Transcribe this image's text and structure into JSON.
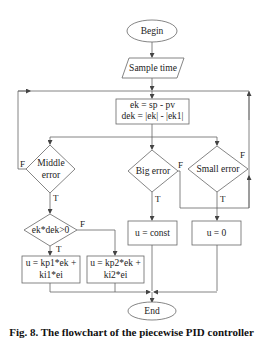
{
  "diagram": {
    "type": "flowchart",
    "nodes": {
      "begin": {
        "label": "Begin",
        "shape": "ellipse"
      },
      "sample": {
        "label": "Sample time",
        "shape": "parallelogram"
      },
      "compute_line1": {
        "label": "ek = sp - pv",
        "shape": "rect"
      },
      "compute_line2": {
        "label": "dek = |ek| - |ek1|",
        "shape": "rect"
      },
      "middle_error_1": {
        "label": "Middle",
        "shape": "diamond"
      },
      "middle_error_2": {
        "label": "error",
        "shape": "diamond"
      },
      "big_error": {
        "label": "Big error",
        "shape": "diamond"
      },
      "small_error": {
        "label": "Small error",
        "shape": "diamond"
      },
      "ekdek": {
        "label": "ek*dek>0",
        "shape": "diamond"
      },
      "u_const": {
        "label": "u = const",
        "shape": "rect"
      },
      "u_zero": {
        "label": "u = 0",
        "shape": "rect"
      },
      "u_pid1_line1": {
        "label": "u = kp1*ek +",
        "shape": "rect"
      },
      "u_pid1_line2": {
        "label": "ki1*ei",
        "shape": "rect"
      },
      "u_pid2_line1": {
        "label": "u = kp2*ek +",
        "shape": "rect"
      },
      "u_pid2_line2": {
        "label": "ki2*ei",
        "shape": "rect"
      },
      "end": {
        "label": "End",
        "shape": "ellipse"
      }
    },
    "edge_labels": {
      "middle_false": "F",
      "middle_true": "T",
      "big_false": "F",
      "big_true": "T",
      "small_false": "F",
      "small_true": "T",
      "ekdek_false": "F",
      "ekdek_true": "T"
    },
    "edges": [
      {
        "from": "Begin",
        "to": "Sample time"
      },
      {
        "from": "Sample time",
        "to": "ek = sp - pv / dek = |ek| - |ek1|"
      },
      {
        "from": "ek = sp - pv / dek = |ek| - |ek1|",
        "to": "Middle error"
      },
      {
        "from": "ek = sp - pv / dek = |ek| - |ek1|",
        "to": "Big error"
      },
      {
        "from": "ek = sp - pv / dek = |ek| - |ek1|",
        "to": "Small error"
      },
      {
        "from": "Middle error",
        "to": "ek*dek>0",
        "label": "T"
      },
      {
        "from": "Middle error",
        "to": "ek = sp - pv / dek = |ek| - |ek1|",
        "label": "F"
      },
      {
        "from": "Big error",
        "to": "u = const",
        "label": "T"
      },
      {
        "from": "Big error",
        "to": "ek = sp - pv / dek = |ek| - |ek1|",
        "label": "F"
      },
      {
        "from": "Small error",
        "to": "u = 0",
        "label": "T"
      },
      {
        "from": "Small error",
        "to": "ek = sp - pv / dek = |ek| - |ek1|",
        "label": "F"
      },
      {
        "from": "ek*dek>0",
        "to": "u = kp1*ek + ki1*ei",
        "label": "T"
      },
      {
        "from": "ek*dek>0",
        "to": "u = kp2*ek + ki2*ei",
        "label": "F"
      },
      {
        "from": "u = kp1*ek + ki1*ei",
        "to": "End"
      },
      {
        "from": "u = kp2*ek + ki2*ei",
        "to": "End"
      },
      {
        "from": "u = const",
        "to": "End"
      },
      {
        "from": "u = 0",
        "to": "End"
      }
    ],
    "colors": {
      "stroke": "#555555",
      "text": "#222222",
      "background": "#ffffff"
    }
  },
  "caption": {
    "text": "Fig. 8. The flowchart of the piecewise PID controller"
  }
}
